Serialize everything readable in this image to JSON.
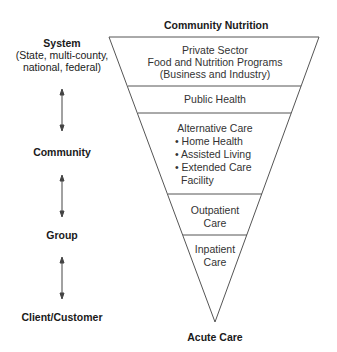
{
  "title_top": "Community Nutrition",
  "title_bottom": "Acute Care",
  "levels": [
    {
      "label": "System",
      "sub": [
        "(State, multi-county,",
        "national, federal)"
      ]
    },
    {
      "label": "Community"
    },
    {
      "label": "Group"
    },
    {
      "label": "Client/Customer"
    }
  ],
  "segments": [
    {
      "lines": [
        "Private Sector",
        "Food and Nutrition Programs",
        "(Business and Industry)"
      ]
    },
    {
      "lines": [
        "Public Health"
      ]
    },
    {
      "title": "Alternative Care",
      "bullets": [
        "Home Health",
        "Assisted Living",
        "Extended Care"
      ],
      "continuation": "Facility"
    },
    {
      "lines": [
        "Outpatient",
        "Care"
      ]
    },
    {
      "lines": [
        "Inpatient",
        "Care"
      ]
    }
  ],
  "arrows": [
    {
      "between": [
        "System",
        "Community"
      ]
    },
    {
      "between": [
        "Community",
        "Group"
      ]
    },
    {
      "between": [
        "Group",
        "Client/Customer"
      ]
    }
  ],
  "colors": {
    "line": "#444444",
    "text": "#1a1a1a"
  }
}
